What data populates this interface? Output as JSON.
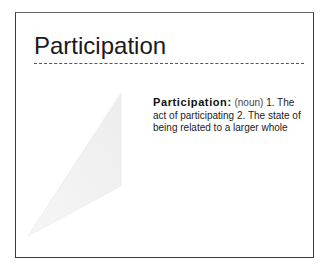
{
  "slide": {
    "title": "Participation",
    "definition": {
      "term": "Participation:",
      "part_of_speech": "(noun)",
      "sense1_num": "1.",
      "sense1": "The act of participating",
      "sense2_num": "2.",
      "sense2": "The state of being related to a larger whole"
    },
    "illustration": "faint-triangle-shape",
    "colors": {
      "border": "#3a3a3a",
      "text": "#222222",
      "triangle_fill": "#f2f2f2"
    }
  }
}
